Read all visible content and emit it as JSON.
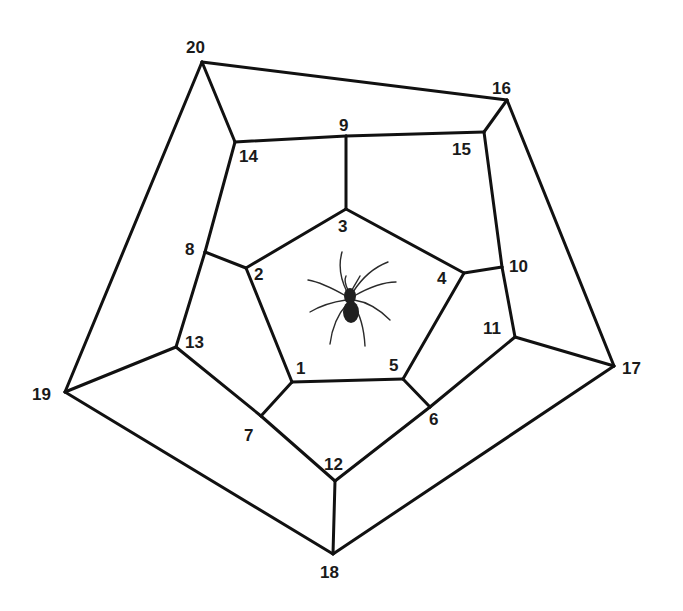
{
  "diagram": {
    "type": "graph",
    "vertices": [
      {
        "id": "1",
        "x": 292,
        "y": 382,
        "lx": 296,
        "ly": 374
      },
      {
        "id": "2",
        "x": 246,
        "y": 268,
        "lx": 254,
        "ly": 280
      },
      {
        "id": "3",
        "x": 346,
        "y": 209,
        "lx": 338,
        "ly": 232
      },
      {
        "id": "4",
        "x": 464,
        "y": 273,
        "lx": 437,
        "ly": 284
      },
      {
        "id": "5",
        "x": 403,
        "y": 379,
        "lx": 389,
        "ly": 371
      },
      {
        "id": "6",
        "x": 430,
        "y": 407,
        "lx": 429,
        "ly": 425
      },
      {
        "id": "7",
        "x": 261,
        "y": 416,
        "lx": 244,
        "ly": 441
      },
      {
        "id": "8",
        "x": 205,
        "y": 252,
        "lx": 185,
        "ly": 255
      },
      {
        "id": "9",
        "x": 346,
        "y": 136,
        "lx": 339,
        "ly": 131
      },
      {
        "id": "10",
        "x": 502,
        "y": 267,
        "lx": 509,
        "ly": 272
      },
      {
        "id": "11",
        "x": 515,
        "y": 337,
        "lx": 483,
        "ly": 334
      },
      {
        "id": "12",
        "x": 335,
        "y": 481,
        "lx": 324,
        "ly": 470
      },
      {
        "id": "13",
        "x": 176,
        "y": 347,
        "lx": 185,
        "ly": 348
      },
      {
        "id": "14",
        "x": 235,
        "y": 142,
        "lx": 239,
        "ly": 162
      },
      {
        "id": "15",
        "x": 484,
        "y": 132,
        "lx": 452,
        "ly": 155
      },
      {
        "id": "16",
        "x": 507,
        "y": 100,
        "lx": 492,
        "ly": 94
      },
      {
        "id": "17",
        "x": 614,
        "y": 366,
        "lx": 622,
        "ly": 374
      },
      {
        "id": "18",
        "x": 333,
        "y": 554,
        "lx": 320,
        "ly": 578
      },
      {
        "id": "19",
        "x": 65,
        "y": 392,
        "lx": 32,
        "ly": 400
      },
      {
        "id": "20",
        "x": 202,
        "y": 62,
        "lx": 186,
        "ly": 53
      }
    ],
    "edges": [
      [
        "20",
        "16"
      ],
      [
        "16",
        "17"
      ],
      [
        "17",
        "18"
      ],
      [
        "18",
        "19"
      ],
      [
        "19",
        "20"
      ],
      [
        "20",
        "14"
      ],
      [
        "16",
        "15"
      ],
      [
        "17",
        "11"
      ],
      [
        "18",
        "12"
      ],
      [
        "19",
        "13"
      ],
      [
        "14",
        "9"
      ],
      [
        "9",
        "15"
      ],
      [
        "15",
        "10"
      ],
      [
        "10",
        "11"
      ],
      [
        "11",
        "6"
      ],
      [
        "6",
        "12"
      ],
      [
        "12",
        "7"
      ],
      [
        "7",
        "13"
      ],
      [
        "13",
        "8"
      ],
      [
        "8",
        "14"
      ],
      [
        "1",
        "2"
      ],
      [
        "2",
        "3"
      ],
      [
        "3",
        "4"
      ],
      [
        "4",
        "5"
      ],
      [
        "5",
        "1"
      ],
      [
        "3",
        "9"
      ],
      [
        "2",
        "8"
      ],
      [
        "4",
        "10"
      ],
      [
        "5",
        "6"
      ],
      [
        "1",
        "7"
      ]
    ],
    "center_icon": "spider-icon",
    "colors": {
      "line": "#111111",
      "label": "#1a1a1a",
      "background": "#ffffff"
    }
  }
}
